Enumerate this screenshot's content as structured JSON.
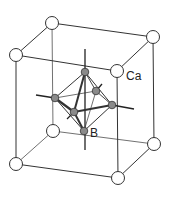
{
  "diagram": {
    "title": "",
    "labels": {
      "ca": "Ca",
      "b": "B"
    },
    "colors": {
      "background": "#ffffff",
      "edge": "#333333",
      "ca_fill": "#ffffff",
      "b_fill": "#8a8a8a"
    },
    "cube_atoms": [
      {
        "id": "top-back-left",
        "x": 52,
        "y": 23
      },
      {
        "id": "top-back-right",
        "x": 153,
        "y": 37
      },
      {
        "id": "top-front-left",
        "x": 16,
        "y": 55
      },
      {
        "id": "top-front-right",
        "x": 117,
        "y": 71
      },
      {
        "id": "bottom-back-left",
        "x": 53,
        "y": 131
      },
      {
        "id": "bottom-back-right",
        "x": 154,
        "y": 144
      },
      {
        "id": "bottom-front-left",
        "x": 16,
        "y": 164
      },
      {
        "id": "bottom-front-right",
        "x": 118,
        "y": 178
      }
    ],
    "octahedron_atoms": [
      {
        "id": "top",
        "x": 85,
        "y": 72
      },
      {
        "id": "bottom",
        "x": 84,
        "y": 131
      },
      {
        "id": "left",
        "x": 55,
        "y": 98
      },
      {
        "id": "right",
        "x": 112,
        "y": 105
      },
      {
        "id": "front",
        "x": 74,
        "y": 112
      },
      {
        "id": "back",
        "x": 96,
        "y": 91
      }
    ]
  }
}
